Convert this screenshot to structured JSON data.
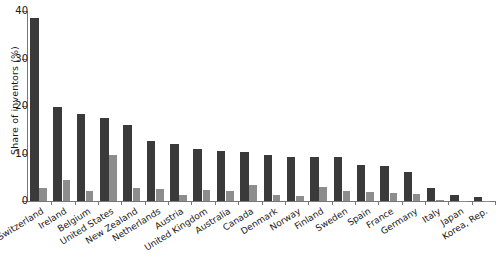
{
  "chart_data": {
    "type": "bar",
    "title": "",
    "subtitle": "",
    "xlabel": "",
    "ylabel": "Share of inventors (%)",
    "ylim": [
      0,
      40
    ],
    "yticks": [
      0,
      10,
      20,
      30,
      40
    ],
    "ytick_labels": [
      "0",
      "10",
      "20",
      "30",
      "40"
    ],
    "grid": false,
    "legend": false,
    "legend_position": "none",
    "orientation": "vertical",
    "grouping": "grouped",
    "categories": [
      "Switzerland",
      "Ireland",
      "Belgium",
      "United States",
      "New Zealand",
      "Netherlands",
      "Austria",
      "United Kingdom",
      "Australia",
      "Canada",
      "Denmark",
      "Norway",
      "Finland",
      "Sweden",
      "Spain",
      "France",
      "Germany",
      "Italy",
      "Japan",
      "Korea, Rep."
    ],
    "series": [
      {
        "name": "series-dark",
        "color": "#3a3a3a",
        "values": [
          38.5,
          19.7,
          18.4,
          17.4,
          15.9,
          12.7,
          11.9,
          11.0,
          10.6,
          10.4,
          9.7,
          9.3,
          9.3,
          9.3,
          7.6,
          7.4,
          6.1,
          2.8,
          1.2,
          0.8
        ]
      },
      {
        "name": "series-light",
        "color": "#8d8d8d",
        "values": [
          2.8,
          4.4,
          2.1,
          9.7,
          2.7,
          2.6,
          1.3,
          2.4,
          2.2,
          3.3,
          1.2,
          1.1,
          2.9,
          2.1,
          1.9,
          1.7,
          1.5,
          0.2,
          0.1,
          0.1
        ]
      }
    ]
  }
}
